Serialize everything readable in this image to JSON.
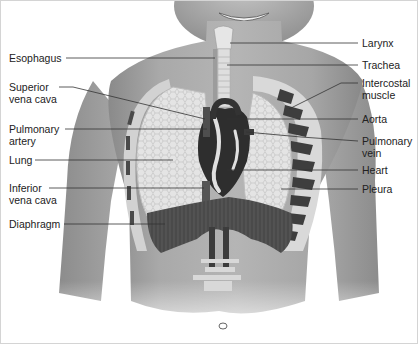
{
  "diagram": {
    "left_labels": [
      {
        "id": "esophagus",
        "lines": [
          "Esophagus"
        ],
        "y": 52
      },
      {
        "id": "superior-vena-cava",
        "lines": [
          "Superior",
          "vena cava"
        ],
        "y": 80
      },
      {
        "id": "pulmonary-artery",
        "lines": [
          "Pulmonary",
          "artery"
        ],
        "y": 123
      },
      {
        "id": "lung",
        "lines": [
          "Lung"
        ],
        "y": 154
      },
      {
        "id": "inferior-vena-cava",
        "lines": [
          "Inferior",
          "vena cava"
        ],
        "y": 181
      },
      {
        "id": "diaphragm",
        "lines": [
          "Diaphragm"
        ],
        "y": 217
      }
    ],
    "right_labels": [
      {
        "id": "larynx",
        "lines": [
          "Larynx"
        ],
        "y": 37
      },
      {
        "id": "trachea",
        "lines": [
          "Trachea"
        ],
        "y": 59
      },
      {
        "id": "intercostal-muscle",
        "lines": [
          "Intercostal",
          "muscle"
        ],
        "y": 77
      },
      {
        "id": "aorta",
        "lines": [
          "Aorta"
        ],
        "y": 113
      },
      {
        "id": "pulmonary-vein",
        "lines": [
          "Pulmonary",
          "vein"
        ],
        "y": 135
      },
      {
        "id": "heart",
        "lines": [
          "Heart"
        ],
        "y": 164
      },
      {
        "id": "pleura",
        "lines": [
          "Pleura"
        ],
        "y": 183
      }
    ]
  }
}
